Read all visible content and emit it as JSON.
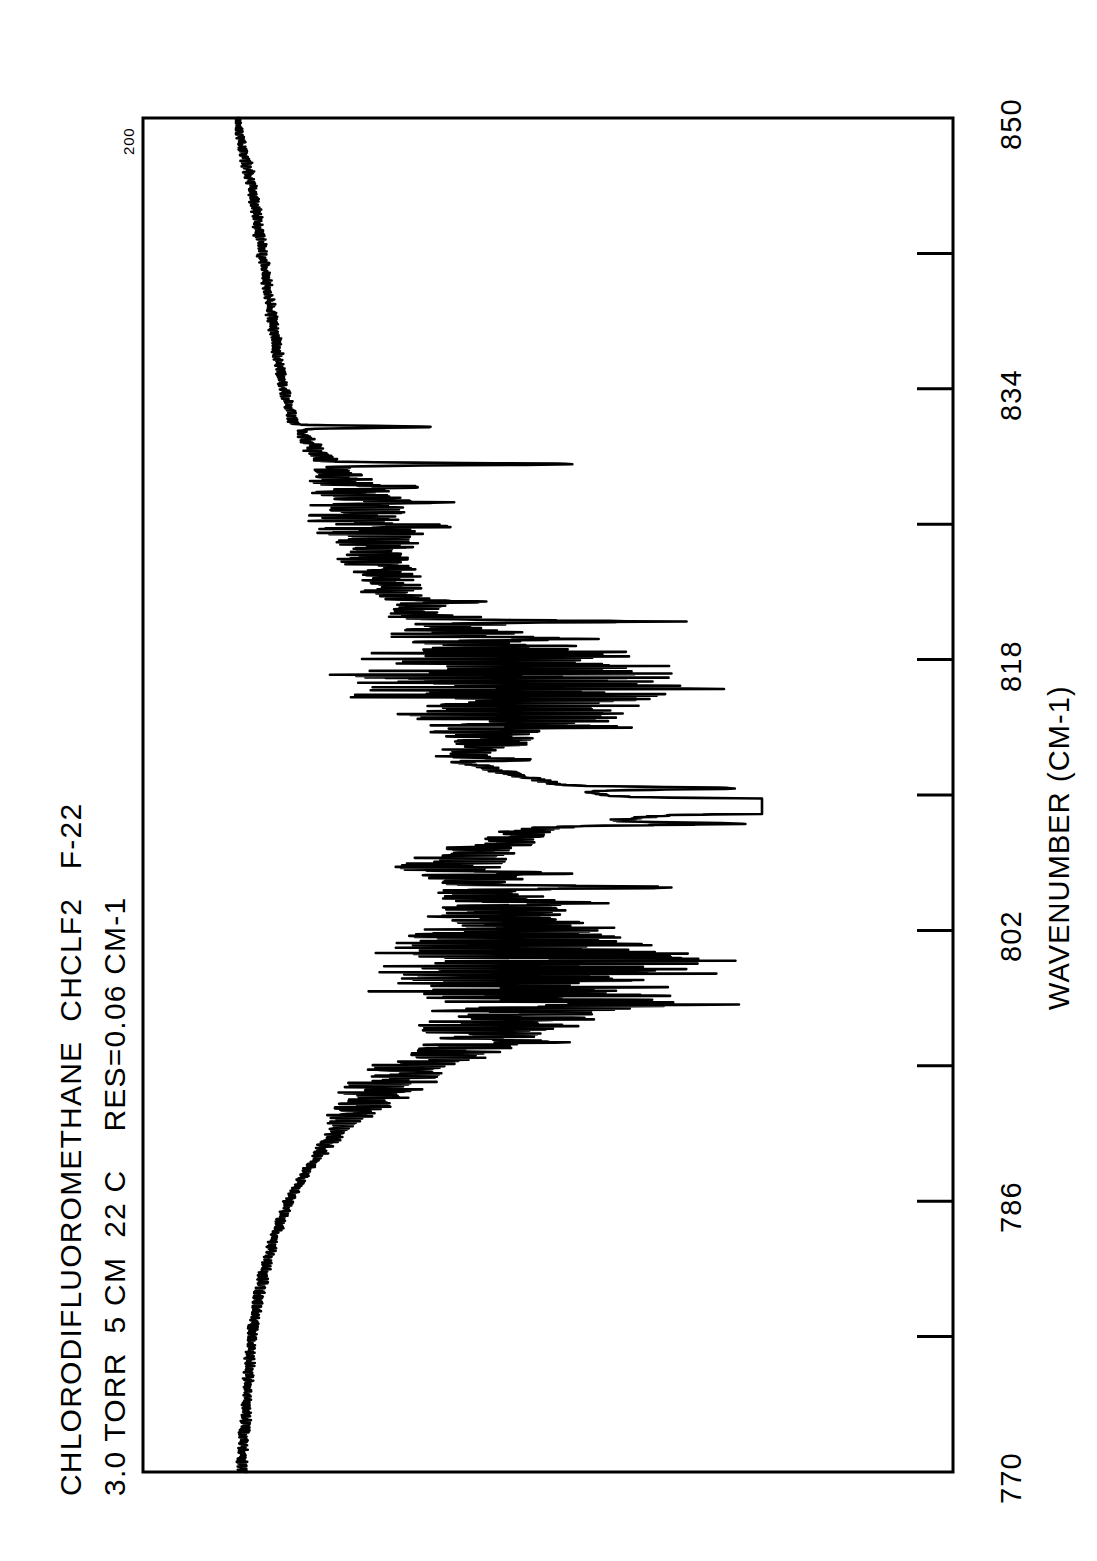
{
  "document": {
    "kind": "infrared-absorption-spectrum-plot",
    "orientation": "landscape-printed-sideways",
    "background_color": "#ffffff",
    "ink_color": "#000000"
  },
  "header": {
    "line1": "CHLORODIFLUOROMETHANE  CHCLF2   F-22",
    "line2": "3.0 TORR  5 CM  22 C    RES=0.06 CM-1",
    "compound_name": "CHLORODIFLUOROMETHANE",
    "formula": "CHCLF2",
    "refrigerant_code": "F-22",
    "pressure": "3.0 TORR",
    "path_length": "5 CM",
    "temperature": "22 C",
    "resolution": "RES=0.06 CM-1"
  },
  "axes": {
    "ordinate_label": "200",
    "abscissa_title": "WAVENUMBER (CM-1)",
    "abscissa_tick_labels": [
      "770",
      "786",
      "802",
      "818",
      "834",
      "850"
    ],
    "abscissa_tick_values": [
      770,
      786,
      802,
      818,
      834,
      850
    ],
    "minor_tick_values": [
      778,
      794,
      810,
      826,
      842
    ],
    "abscissa_range": [
      770,
      850
    ],
    "abscissa_step": 8,
    "grid": false,
    "frame": true
  },
  "chart_data": {
    "type": "line",
    "title": "CHLORODIFLUOROMETHANE  CHCLF2   F-22",
    "subtitle": "3.0 TORR  5 CM  22 C    RES=0.06 CM-1",
    "xlabel": "WAVENUMBER (CM-1)",
    "ylabel": "200",
    "xlim": [
      770,
      850
    ],
    "ylim": [
      0,
      200
    ],
    "grid": false,
    "legend": false,
    "series_name": "transmittance-trace",
    "bands": [
      {
        "center": 809.3,
        "label": "Q-branch / strongest absorption",
        "relative_depth": 1.0
      },
      {
        "center": 816.5,
        "label": "dense rotational manifold (P/R congestion)",
        "relative_depth": 0.62
      },
      {
        "center": 799.5,
        "label": "dense rotational manifold",
        "relative_depth": 0.6
      },
      {
        "center": 829.5,
        "label": "sharp isolated line",
        "relative_depth": 0.4
      },
      {
        "center": 831.7,
        "label": "sharp isolated line",
        "relative_depth": 0.22
      },
      {
        "center": 804.5,
        "label": "sharp isolated line",
        "relative_depth": 0.33
      },
      {
        "center": 820.2,
        "label": "sharp isolated line",
        "relative_depth": 0.32
      }
    ],
    "x": [
      850.0,
      848.0,
      846.0,
      844.0,
      842.0,
      840.0,
      838.0,
      836.0,
      834.0,
      832.0,
      830.0,
      828.0,
      826.0,
      824.0,
      822.0,
      820.0,
      818.0,
      816.0,
      814.0,
      812.0,
      810.0,
      809.3,
      808.0,
      806.0,
      804.0,
      802.0,
      800.0,
      798.0,
      796.0,
      794.0,
      792.0,
      790.0,
      788.0,
      786.0,
      784.0,
      782.0,
      780.0,
      778.0,
      776.0,
      774.0,
      772.0,
      770.0
    ],
    "y": [
      200,
      197,
      194,
      192,
      190,
      188,
      186,
      184,
      182,
      178,
      168,
      158,
      150,
      146,
      140,
      120,
      96,
      88,
      96,
      116,
      60,
      8,
      86,
      118,
      104,
      92,
      80,
      86,
      104,
      130,
      150,
      162,
      172,
      180,
      185,
      189,
      192,
      194,
      195,
      196,
      197,
      198
    ],
    "y_description": "arbitrary transmittance-like units; 200 = full-scale baseline at top of ordinate, 0 = deepest absorption"
  }
}
